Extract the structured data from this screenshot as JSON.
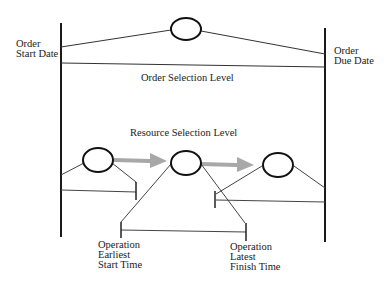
{
  "diagram": {
    "left_boundary": {
      "line1": "Order",
      "line2": "Start Date"
    },
    "right_boundary": {
      "line1": "Order",
      "line2": "Due Date"
    },
    "order_level_label": "Order Selection Level",
    "resource_level_label": "Resource Selection Level",
    "earliest": {
      "line1": "Operation",
      "line2": "Earliest",
      "line3": "Start Time"
    },
    "latest": {
      "line1": "Operation",
      "line2": "Latest",
      "line3": "Finish Time"
    },
    "colors": {
      "line": "#1a1a1a",
      "thin_line": "#444444",
      "arrow": "#a8a8a8"
    },
    "nodes": [
      {
        "id": "order-node",
        "level": "order"
      },
      {
        "id": "operation-1",
        "level": "resource"
      },
      {
        "id": "operation-2",
        "level": "resource"
      },
      {
        "id": "operation-3",
        "level": "resource"
      }
    ]
  }
}
